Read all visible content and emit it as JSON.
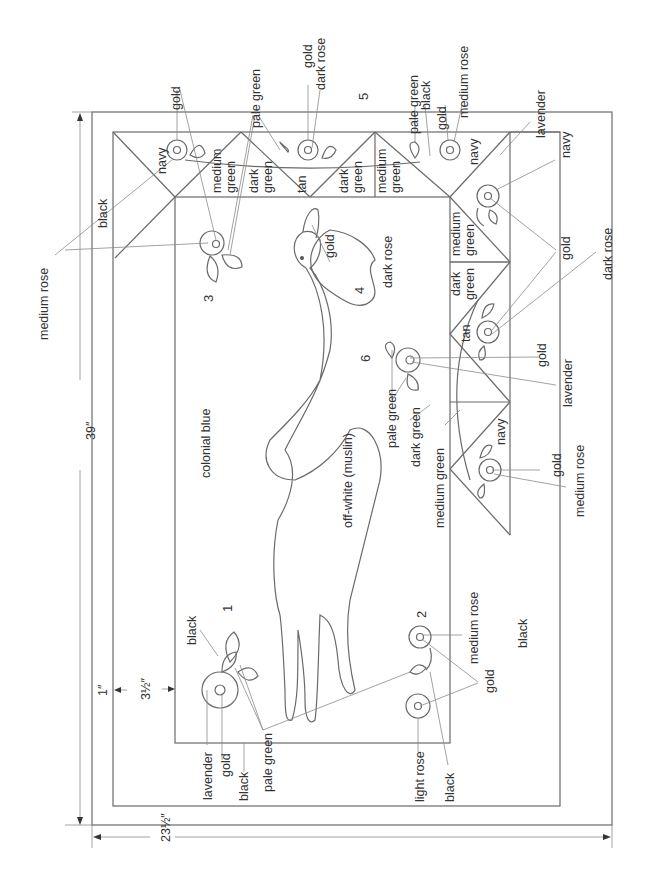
{
  "diagram": {
    "dimensions": {
      "height": "39″",
      "width": "23½″",
      "outer_border": "1″",
      "inner_border": "3½″"
    },
    "numbers": [
      "1",
      "2",
      "3",
      "4",
      "5",
      "6"
    ],
    "borders": {
      "outer_left": "black",
      "outer_right": "black",
      "inner_panel": "colonial blue"
    },
    "center": {
      "goose_body": "off-white (muslin)",
      "goose_beak": "gold",
      "heart": "dark rose"
    },
    "top_border_triangles": [
      "navy",
      "medium green",
      "dark green",
      "tan",
      "dark green",
      "medium green",
      "navy"
    ],
    "right_border_triangles": [
      "lavender",
      "medium green",
      "dark green",
      "tan",
      "navy"
    ],
    "right_border_labels": [
      "dark green",
      "medium green"
    ],
    "callouts": {
      "top_left_flower": [
        "gold",
        "medium rose"
      ],
      "flower3": [
        "gold",
        "pale green"
      ],
      "top_middle_flower": [
        "gold",
        "dark rose",
        "pale green"
      ],
      "top_right_flower": [
        "pale green",
        "black",
        "gold",
        "medium rose"
      ],
      "corner_flower": [
        "navy",
        "gold",
        "lavender"
      ],
      "right_flowers": [
        "gold",
        "dark rose"
      ],
      "flower6": [
        "gold",
        "lavender",
        "pale green"
      ],
      "bottom_right_flower": [
        "gold",
        "medium rose"
      ],
      "flower1": [
        "black",
        "lavender",
        "gold",
        "black",
        "pale green"
      ],
      "flower2": [
        "medium rose",
        "gold",
        "light rose",
        "black"
      ],
      "left_label": "medium rose"
    },
    "labels": {
      "medium_rose_left": "medium rose",
      "black_top": "black",
      "black_bottom": "black",
      "colonial_blue": "colonial blue",
      "off_white": "off-white (muslin)",
      "gold_beak": "gold",
      "dark_rose_heart": "dark rose",
      "navy_top": "navy",
      "medium_green_1": "medium",
      "medium_green_1b": "green",
      "dark_green_1": "dark",
      "dark_green_1b": "green",
      "tan_1": "tan",
      "dark_green_2": "dark",
      "dark_green_2b": "green",
      "medium_green_2": "medium",
      "medium_green_2b": "green",
      "navy_right_top": "navy",
      "lavender_corner": "lavender",
      "navy_corner": "navy",
      "medium_r": "medium",
      "green_r": "green",
      "dark_r": "dark",
      "green_r2": "green",
      "tan_r": "tan",
      "navy_r": "navy",
      "gold_t1": "gold",
      "pale_green_t": "pale green",
      "gold_t2": "gold",
      "dark_rose_t": "dark rose",
      "pale_green_t2": "pale green",
      "black_t": "black",
      "gold_t3": "gold",
      "medium_rose_t": "medium rose",
      "gold_r1": "gold",
      "dark_rose_r": "dark rose",
      "gold_6": "gold",
      "lavender_6": "lavender",
      "pale_green_6": "pale green",
      "dark_green_6": "dark green",
      "medium_green_6": "medium green",
      "gold_br": "gold",
      "medium_rose_br": "medium rose",
      "medium_rose_2": "medium rose",
      "gold_2": "gold",
      "light_rose_2": "light rose",
      "black_2": "black",
      "black_1": "black",
      "lavender_1": "lavender",
      "gold_1": "gold",
      "black_1b": "black",
      "pale_green_1": "pale green"
    }
  }
}
